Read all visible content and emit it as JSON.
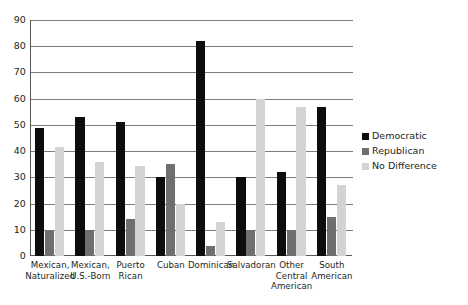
{
  "chart_data": {
    "type": "bar",
    "title": "",
    "subtitle": "",
    "xlabel": "",
    "ylabel": "",
    "ylim": [
      0,
      90
    ],
    "ytick_step": 10,
    "yticks": [
      0,
      10,
      20,
      30,
      40,
      50,
      60,
      70,
      80,
      90
    ],
    "ytick_labels": [
      "0",
      "10",
      "20",
      "30",
      "40",
      "50",
      "60",
      "70",
      "80",
      "90"
    ],
    "grid": "horizontal",
    "legend_position": "right",
    "categories": [
      "Mexican,\nNaturalized",
      "Mexican,\nU.S.-Born",
      "Puerto\nRican",
      "Cuban",
      "Dominican",
      "Salvadoran",
      "Other\nCentral\nAmerican",
      "South\nAmerican"
    ],
    "category_lines": [
      [
        "Mexican,",
        "Naturalized"
      ],
      [
        "Mexican,",
        "U.S.-Born"
      ],
      [
        "Puerto",
        "Rican"
      ],
      [
        "Cuban"
      ],
      [
        "Dominican"
      ],
      [
        "Salvadoran"
      ],
      [
        "Other",
        "Central",
        "American"
      ],
      [
        "South",
        "American"
      ]
    ],
    "series": [
      {
        "name": "Democratic",
        "color": "#0d0d0d",
        "values": [
          49,
          53,
          51,
          30,
          82,
          30,
          32,
          57
        ]
      },
      {
        "name": "Republican",
        "color": "#6e6f71",
        "values": [
          9.5,
          10,
          14,
          35,
          4,
          10,
          10,
          15
        ]
      },
      {
        "name": "No Difference",
        "color": "#d2d3d4",
        "values": [
          41.5,
          36,
          34.5,
          20,
          13,
          60,
          57,
          27
        ]
      }
    ]
  },
  "legend": {
    "items": [
      {
        "label": "Democratic",
        "color": "#0d0d0d"
      },
      {
        "label": "Republican",
        "color": "#6e6f71"
      },
      {
        "label": "No Difference",
        "color": "#d2d3d4"
      }
    ]
  },
  "colors": {
    "axis": "#58595b",
    "grid": "#7a7c7f",
    "text": "#231f20",
    "background": "#ffffff",
    "democratic": "#0d0d0d",
    "republican": "#6e6f71",
    "no_difference": "#d2d3d4"
  }
}
